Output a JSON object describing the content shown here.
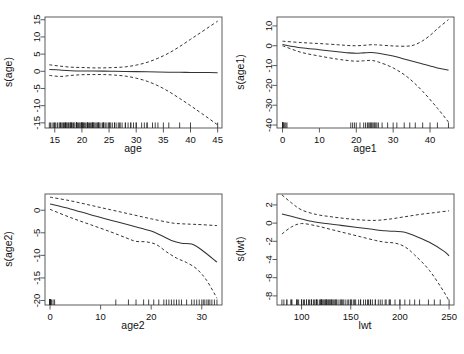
{
  "figure": {
    "layout": "2x2 panel grid of GAM smooth term plots",
    "background": "#ffffff",
    "line_color": "#333333",
    "dash_color": "#333333"
  },
  "chart_data": [
    {
      "type": "line",
      "title": "",
      "xlabel": "age",
      "ylabel": "s(age)",
      "xlim": [
        13.2,
        45.8
      ],
      "ylim": [
        -16.5,
        15.8
      ],
      "xticks": [
        15,
        20,
        25,
        30,
        35,
        40,
        45
      ],
      "yticks": [
        -15,
        -10,
        -5,
        0,
        5,
        10,
        15
      ],
      "grid": false,
      "legend": "none",
      "series": [
        {
          "name": "fit",
          "style": "solid",
          "x": [
            14,
            16,
            18,
            20,
            22,
            24,
            26,
            28,
            30,
            32,
            34,
            36,
            38,
            40,
            42,
            45
          ],
          "values": [
            0.55,
            0.35,
            0.18,
            0.1,
            0.08,
            0.05,
            0.0,
            -0.05,
            -0.1,
            -0.15,
            -0.2,
            -0.25,
            -0.3,
            -0.32,
            -0.35,
            -0.4
          ]
        },
        {
          "name": "upper",
          "style": "dashed",
          "x": [
            14,
            16,
            18,
            20,
            22,
            24,
            26,
            28,
            30,
            32,
            34,
            36,
            38,
            40,
            42,
            45
          ],
          "values": [
            1.9,
            1.5,
            1.2,
            1.1,
            1.0,
            1.0,
            1.1,
            1.3,
            1.8,
            2.6,
            3.8,
            5.3,
            7.2,
            9.3,
            11.4,
            14.6
          ]
        },
        {
          "name": "lower",
          "style": "dashed",
          "x": [
            14,
            16,
            18,
            20,
            22,
            24,
            26,
            28,
            30,
            32,
            34,
            36,
            38,
            40,
            42,
            45
          ],
          "values": [
            -1.2,
            -1.5,
            -1.2,
            -1.0,
            -0.95,
            -0.95,
            -1.1,
            -1.4,
            -2.0,
            -2.9,
            -4.2,
            -5.9,
            -7.9,
            -10.0,
            -12.2,
            -15.6
          ]
        }
      ],
      "rug": {
        "axis": "x",
        "values": [
          14.0,
          14.2,
          14.5,
          14.8,
          15.0,
          15.0,
          15.2,
          15.5,
          15.8,
          16.0,
          16.0,
          16.1,
          16.3,
          16.5,
          16.6,
          16.8,
          17.0,
          17.0,
          17.0,
          17.1,
          17.3,
          17.5,
          17.6,
          17.8,
          18.0,
          18.0,
          18.0,
          18.0,
          18.2,
          18.4,
          18.5,
          18.7,
          19.0,
          19.0,
          19.0,
          19.0,
          19.0,
          19.2,
          19.4,
          19.5,
          19.7,
          20.0,
          20.0,
          20.0,
          20.0,
          20.0,
          20.2,
          20.3,
          20.5,
          20.7,
          21.0,
          21.0,
          21.0,
          21.0,
          21.2,
          21.4,
          21.6,
          21.8,
          22.0,
          22.0,
          22.0,
          22.0,
          22.2,
          22.4,
          22.6,
          22.8,
          23.0,
          23.0,
          23.0,
          23.2,
          23.5,
          23.8,
          24.0,
          24.0,
          24.0,
          24.3,
          24.6,
          25.0,
          25.0,
          25.0,
          25.3,
          25.6,
          26.0,
          26.0,
          26.3,
          26.7,
          27.0,
          27.0,
          27.4,
          28.0,
          28.0,
          28.5,
          29.0,
          29.0,
          29.5,
          30.0,
          30.0,
          31.0,
          31.5,
          32.0,
          32.0,
          33.0,
          33.5,
          34.0,
          35.0,
          36.0,
          38.0,
          40.0,
          45.0
        ]
      }
    },
    {
      "type": "line",
      "title": "",
      "xlabel": "age1",
      "ylabel": "s(age1)",
      "xlim": [
        -1.5,
        46.5
      ],
      "ylim": [
        -41.5,
        14.5
      ],
      "xticks": [
        0,
        10,
        20,
        30,
        40
      ],
      "yticks": [
        -40,
        -30,
        -20,
        -10,
        0,
        10
      ],
      "grid": false,
      "legend": "none",
      "series": [
        {
          "name": "fit",
          "style": "solid",
          "x": [
            0,
            5,
            10,
            15,
            18,
            20,
            22,
            24,
            26,
            30,
            34,
            38,
            42,
            45
          ],
          "values": [
            0.6,
            -1.0,
            -2.0,
            -3.0,
            -3.6,
            -3.8,
            -3.6,
            -3.4,
            -3.8,
            -5.2,
            -7.2,
            -9.2,
            -11.2,
            -12.3
          ]
        },
        {
          "name": "upper",
          "style": "dashed",
          "x": [
            0,
            5,
            10,
            15,
            18,
            20,
            22,
            24,
            26,
            30,
            34,
            36,
            38,
            40,
            42,
            45
          ],
          "values": [
            2.3,
            1.6,
            1.1,
            0.5,
            0.1,
            0.0,
            0.2,
            0.5,
            0.4,
            -0.1,
            -0.2,
            0.6,
            2.5,
            5.2,
            8.6,
            13.2
          ]
        },
        {
          "name": "lower",
          "style": "dashed",
          "x": [
            0,
            5,
            10,
            15,
            18,
            20,
            22,
            24,
            26,
            30,
            34,
            38,
            42,
            45
          ],
          "values": [
            0.0,
            -3.3,
            -5.2,
            -6.8,
            -7.5,
            -7.8,
            -7.6,
            -7.4,
            -8.2,
            -11.2,
            -16.0,
            -23.0,
            -31.5,
            -38.5
          ]
        }
      ],
      "rug": {
        "axis": "x",
        "values": [
          0,
          0,
          0,
          0,
          0,
          0,
          0,
          0,
          0,
          0,
          0,
          0,
          0,
          0,
          0,
          0,
          0,
          0,
          0,
          0,
          0,
          0,
          0,
          0,
          0,
          0,
          0.3,
          0.6,
          0.9,
          1.2,
          18.5,
          19.0,
          19.5,
          20.0,
          21.0,
          22.0,
          22.5,
          23.0,
          23.2,
          23.5,
          23.8,
          24.0,
          24.2,
          24.5,
          24.8,
          25.0,
          25.3,
          25.6,
          26.0,
          27.0,
          28.5,
          30.0,
          31.0,
          33.0,
          34.5,
          36.0,
          38.0,
          40.0,
          42.0,
          45.0
        ]
      }
    },
    {
      "type": "line",
      "title": "",
      "xlabel": "age2",
      "ylabel": "s(age2)",
      "xlim": [
        -1.0,
        34.0
      ],
      "ylim": [
        -21.0,
        3.6
      ],
      "xticks": [
        0,
        10,
        20,
        30
      ],
      "yticks": [
        -20,
        -15,
        -10,
        -5,
        0
      ],
      "grid": false,
      "legend": "none",
      "series": [
        {
          "name": "fit",
          "style": "solid",
          "x": [
            0,
            4,
            8,
            12,
            16,
            18,
            20,
            22,
            24,
            26,
            28,
            30,
            33
          ],
          "values": [
            1.4,
            0.3,
            -1.0,
            -2.2,
            -3.4,
            -4.0,
            -4.6,
            -5.6,
            -6.7,
            -7.3,
            -7.5,
            -8.8,
            -11.5
          ]
        },
        {
          "name": "upper",
          "style": "dashed",
          "x": [
            0,
            4,
            8,
            12,
            16,
            20,
            24,
            26,
            28,
            30,
            33
          ],
          "values": [
            2.9,
            2.1,
            1.1,
            0.1,
            -0.9,
            -1.9,
            -2.8,
            -3.0,
            -3.1,
            -3.2,
            -3.4
          ]
        },
        {
          "name": "lower",
          "style": "dashed",
          "x": [
            0,
            4,
            8,
            12,
            15,
            17,
            19,
            21,
            23,
            25,
            27,
            29,
            31,
            33
          ],
          "values": [
            0.2,
            -1.6,
            -3.2,
            -4.8,
            -6.1,
            -6.9,
            -7.0,
            -7.6,
            -9.2,
            -10.6,
            -11.6,
            -13.0,
            -15.6,
            -19.5
          ]
        }
      ],
      "rug": {
        "axis": "x",
        "values": [
          0,
          0,
          0,
          0,
          0,
          0,
          0,
          0,
          0,
          0,
          0,
          0,
          0,
          0,
          0,
          0,
          0,
          0,
          0,
          0,
          0,
          0,
          0,
          0,
          0,
          0.3,
          0.6,
          0.9,
          13.0,
          15.5,
          17.0,
          18.5,
          19.5,
          20.5,
          21.5,
          22.5,
          23.0,
          23.5,
          24.0,
          24.5,
          25.0,
          25.5,
          26.0,
          27.0,
          28.0,
          28.5,
          29.0,
          29.5,
          30.0,
          30.3,
          30.6,
          31.0,
          31.3,
          31.6,
          32.0,
          32.5,
          33.0
        ]
      }
    },
    {
      "type": "line",
      "title": "",
      "xlabel": "lwt",
      "ylabel": "s(lwt)",
      "xlim": [
        75,
        255
      ],
      "ylim": [
        -9.0,
        3.2
      ],
      "xticks": [
        100,
        150,
        200,
        250
      ],
      "yticks": [
        -8,
        -6,
        -4,
        -2,
        0,
        2
      ],
      "grid": false,
      "legend": "none",
      "series": [
        {
          "name": "fit",
          "style": "solid",
          "x": [
            80,
            95,
            110,
            125,
            140,
            155,
            170,
            185,
            195,
            205,
            215,
            230,
            245,
            250
          ],
          "values": [
            1.0,
            0.6,
            0.2,
            -0.05,
            -0.25,
            -0.45,
            -0.65,
            -0.85,
            -0.9,
            -1.0,
            -1.4,
            -2.1,
            -3.1,
            -3.6
          ]
        },
        {
          "name": "upper",
          "style": "dashed",
          "x": [
            80,
            90,
            100,
            115,
            130,
            145,
            160,
            175,
            190,
            205,
            220,
            235,
            250
          ],
          "values": [
            3.1,
            2.2,
            1.45,
            0.95,
            0.7,
            0.5,
            0.35,
            0.3,
            0.45,
            0.7,
            0.95,
            1.15,
            1.35
          ]
        },
        {
          "name": "lower",
          "style": "dashed",
          "x": [
            80,
            90,
            100,
            115,
            130,
            145,
            160,
            175,
            185,
            195,
            205,
            215,
            230,
            245,
            250
          ],
          "values": [
            -1.2,
            -0.4,
            -0.05,
            -0.3,
            -0.7,
            -1.1,
            -1.5,
            -1.9,
            -2.1,
            -2.2,
            -2.6,
            -3.5,
            -5.2,
            -7.6,
            -8.6
          ]
        }
      ],
      "rug": {
        "axis": "x",
        "values": [
          80,
          82,
          85,
          85,
          89,
          90,
          90,
          95,
          95,
          96,
          97,
          100,
          100,
          100,
          102,
          103,
          105,
          105,
          107,
          108,
          110,
          110,
          110,
          112,
          113,
          115,
          115,
          115,
          116,
          118,
          119,
          120,
          120,
          120,
          120,
          121,
          122,
          123,
          124,
          125,
          125,
          125,
          126,
          127,
          128,
          128,
          130,
          130,
          130,
          131,
          132,
          133,
          134,
          135,
          135,
          136,
          138,
          140,
          140,
          141,
          142,
          143,
          145,
          147,
          148,
          150,
          150,
          151,
          153,
          154,
          155,
          158,
          160,
          160,
          163,
          165,
          167,
          168,
          170,
          170,
          172,
          175,
          175,
          178,
          180,
          182,
          185,
          186,
          189,
          190,
          190,
          195,
          200,
          200,
          205,
          210,
          215,
          220,
          229,
          235,
          241,
          250
        ]
      }
    }
  ]
}
